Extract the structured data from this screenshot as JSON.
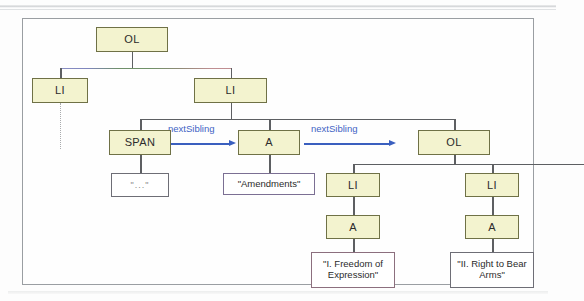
{
  "figure": {
    "type": "dom-tree-diagram",
    "title": "",
    "nodes": [
      {
        "id": "ol-root",
        "label": "OL",
        "kind": "element",
        "x": 95,
        "y": 26,
        "w": 72,
        "h": 25
      },
      {
        "id": "li-left",
        "label": "LI",
        "kind": "element",
        "x": 33,
        "y": 66,
        "w": 56,
        "h": 25
      },
      {
        "id": "li-right",
        "label": "LI",
        "kind": "element",
        "x": 176,
        "y": 66,
        "w": 72,
        "h": 25
      },
      {
        "id": "span",
        "label": "SPAN",
        "kind": "element",
        "x": 108,
        "y": 118,
        "w": 62,
        "h": 25
      },
      {
        "id": "a-amendments",
        "label": "A",
        "kind": "element",
        "x": 237,
        "y": 118,
        "w": 62,
        "h": 25
      },
      {
        "id": "ol-nested",
        "label": "OL",
        "kind": "element",
        "x": 396,
        "y": 118,
        "w": 72,
        "h": 25
      },
      {
        "id": "li-n1",
        "label": "LI",
        "kind": "element",
        "x": 325,
        "y": 160,
        "w": 54,
        "h": 25
      },
      {
        "id": "li-n2",
        "label": "LI",
        "kind": "element",
        "x": 464,
        "y": 160,
        "w": 54,
        "h": 25
      },
      {
        "id": "a-n1",
        "label": "A",
        "kind": "element",
        "x": 325,
        "y": 202,
        "w": 54,
        "h": 25
      },
      {
        "id": "a-n2",
        "label": "A",
        "kind": "element",
        "x": 464,
        "y": 202,
        "w": 54,
        "h": 25
      },
      {
        "id": "text-ellipsis",
        "label": "\"...\"",
        "kind": "textnode",
        "x": 110,
        "y": 160,
        "w": 58,
        "h": 25
      },
      {
        "id": "text-amend",
        "label": "\"Amendments\"",
        "kind": "textnode",
        "x": 221,
        "y": 160,
        "w": 80,
        "h": 23
      },
      {
        "id": "text-freedom",
        "label": "\"I. Freedom of Expression\"",
        "kind": "textnode",
        "x": 310,
        "y": 239,
        "w": 84,
        "h": 36
      },
      {
        "id": "text-beararms",
        "label": "\"II. Right to Bear Arms\"",
        "kind": "textnode",
        "x": 449,
        "y": 239,
        "w": 84,
        "h": 36
      }
    ],
    "arrows": [
      {
        "id": "arrow-span-to-a",
        "label": "nextSibling",
        "label_x": 172,
        "label_y": 110,
        "x": 172,
        "y": 133,
        "w": 62
      },
      {
        "id": "arrow-a-to-ol",
        "label": "nextSibling",
        "label_x": 311,
        "label_y": 110,
        "x": 303,
        "y": 133,
        "w": 88
      }
    ],
    "colors": {
      "element_fill": "#f3f3cf",
      "element_border": "#6f7146",
      "textnode_fill": "#ffffff",
      "textnode_border": "#6e6e76",
      "connector": "#5d5f62",
      "arrow": "#3a5fbf",
      "arrow_label": "#3f63c4",
      "panel_border": "#9a9ea2",
      "page_background": "#fdfdfd"
    }
  }
}
